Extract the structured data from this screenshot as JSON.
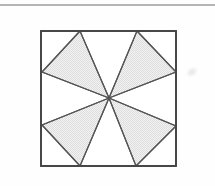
{
  "page": {
    "width": 215,
    "height": 186,
    "background_color": "#fefefe",
    "caption": ""
  },
  "top_rule": {
    "label": "page-top-rule",
    "x1": 0,
    "y1": 5,
    "x2": 215,
    "y2": 5,
    "color": "#6d6d6d",
    "stroke_width": 1.1
  },
  "artifact": {
    "label": "scan-artifact",
    "cx": 192,
    "cy": 72,
    "color": "#e4e4e4"
  },
  "figure": {
    "square": {
      "left": 41,
      "top": 31,
      "right": 176,
      "bottom": 166,
      "stroke_color": "#444444",
      "stroke_width": 1.7,
      "fill": "#ffffff"
    },
    "center": {
      "x": 109,
      "y": 98
    },
    "styles": {
      "shaded_fill": "#ebebeb",
      "unshaded_fill": "#ffffff",
      "line_color": "#555555",
      "line_width": 1.2
    },
    "perimeter_points": [
      {
        "name": "top-left-apex",
        "x": 80,
        "y": 31,
        "edge": "top"
      },
      {
        "name": "top-right-apex",
        "x": 137,
        "y": 31,
        "edge": "top"
      },
      {
        "name": "right-upper-apex",
        "x": 176,
        "y": 72,
        "edge": "right"
      },
      {
        "name": "right-lower-apex",
        "x": 176,
        "y": 126,
        "edge": "right"
      },
      {
        "name": "bottom-right-apex",
        "x": 136,
        "y": 166,
        "edge": "bottom"
      },
      {
        "name": "bottom-left-apex",
        "x": 80,
        "y": 166,
        "edge": "bottom"
      },
      {
        "name": "left-lower-apex",
        "x": 42,
        "y": 125,
        "edge": "left"
      },
      {
        "name": "left-upper-apex",
        "x": 42,
        "y": 72,
        "edge": "left"
      }
    ],
    "triangles": [
      {
        "name": "triangle-upper-left",
        "shaded": true,
        "points": "80,31 42,72 109,98"
      },
      {
        "name": "triangle-upper-right",
        "shaded": true,
        "points": "137,31 176,72 109,98"
      },
      {
        "name": "triangle-lower-right",
        "shaded": true,
        "points": "176,126 136,166 109,98"
      },
      {
        "name": "triangle-lower-left",
        "shaded": true,
        "points": "42,125 80,166 109,98"
      },
      {
        "name": "triangle-top-white",
        "shaded": false,
        "points": "80,31 137,31 109,98"
      },
      {
        "name": "triangle-right-white",
        "shaded": false,
        "points": "176,72 176,126 109,98"
      },
      {
        "name": "triangle-bottom-white",
        "shaded": false,
        "points": "136,166 80,166 109,98"
      },
      {
        "name": "triangle-left-white",
        "shaded": false,
        "points": "42,125 42,72 109,98"
      }
    ],
    "radial_lines": [
      {
        "name": "spoke-to-top-left-apex",
        "x2": 80,
        "y2": 31
      },
      {
        "name": "spoke-to-top-right-apex",
        "x2": 137,
        "y2": 31
      },
      {
        "name": "spoke-to-right-upper-apex",
        "x2": 176,
        "y2": 72
      },
      {
        "name": "spoke-to-right-lower-apex",
        "x2": 176,
        "y2": 126
      },
      {
        "name": "spoke-to-bottom-right-apex",
        "x2": 136,
        "y2": 166
      },
      {
        "name": "spoke-to-bottom-left-apex",
        "x2": 80,
        "y2": 166
      },
      {
        "name": "spoke-to-left-lower-apex",
        "x2": 42,
        "y2": 125
      },
      {
        "name": "spoke-to-left-upper-apex",
        "x2": 42,
        "y2": 72
      }
    ],
    "chords": [
      {
        "name": "chord-upper-left",
        "x1": 80,
        "y1": 31,
        "x2": 42,
        "y2": 72
      },
      {
        "name": "chord-upper-right",
        "x1": 137,
        "y1": 31,
        "x2": 176,
        "y2": 72
      },
      {
        "name": "chord-lower-right",
        "x1": 176,
        "y1": 126,
        "x2": 136,
        "y2": 166
      },
      {
        "name": "chord-lower-left",
        "x1": 42,
        "y1": 125,
        "x2": 80,
        "y2": 166
      }
    ]
  }
}
